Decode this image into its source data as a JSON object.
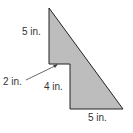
{
  "figure": {
    "type": "composite-polygon",
    "fill": "#bdbdbd",
    "stroke": "#222222",
    "labels": [
      {
        "id": "top-left-side",
        "text": "5 in.",
        "x": 22,
        "y": 31
      },
      {
        "id": "step-width",
        "text": "2 in.",
        "x": 3,
        "y": 77
      },
      {
        "id": "lower-left-side",
        "text": "4 in.",
        "x": 44,
        "y": 85
      },
      {
        "id": "bottom-side",
        "text": "5 in.",
        "x": 88,
        "y": 114
      }
    ]
  }
}
